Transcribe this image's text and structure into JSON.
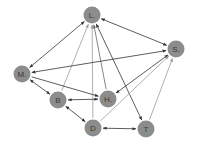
{
  "graph": {
    "nodes": [
      {
        "id": "L",
        "label": "L."
      },
      {
        "id": "S",
        "label": "S."
      },
      {
        "id": "M",
        "label": "M."
      },
      {
        "id": "B",
        "label": "B"
      },
      {
        "id": "H",
        "label": "H."
      },
      {
        "id": "D",
        "label": "D"
      },
      {
        "id": "T",
        "label": "T"
      }
    ],
    "edges": [
      {
        "from": "L",
        "to": "M",
        "dir": "both",
        "tone": "dark"
      },
      {
        "from": "L",
        "to": "S",
        "dir": "both",
        "tone": "dark"
      },
      {
        "from": "B",
        "to": "L",
        "dir": "forward",
        "tone": "light"
      },
      {
        "from": "D",
        "to": "L",
        "dir": "forward",
        "tone": "light"
      },
      {
        "from": "H",
        "to": "L",
        "dir": "forward",
        "tone": "mid"
      },
      {
        "from": "L",
        "to": "T",
        "dir": "both",
        "tone": "dark"
      },
      {
        "from": "M",
        "to": "S",
        "dir": "both",
        "tone": "dark"
      },
      {
        "from": "M",
        "to": "H",
        "dir": "forward",
        "tone": "dark"
      },
      {
        "from": "M",
        "to": "B",
        "dir": "both",
        "tone": "dark"
      },
      {
        "from": "B",
        "to": "H",
        "dir": "both",
        "tone": "dark"
      },
      {
        "from": "B",
        "to": "D",
        "dir": "both",
        "tone": "dark"
      },
      {
        "from": "D",
        "to": "T",
        "dir": "both",
        "tone": "dark"
      },
      {
        "from": "S",
        "to": "H",
        "dir": "both",
        "tone": "dark"
      },
      {
        "from": "D",
        "to": "S",
        "dir": "forward",
        "tone": "light"
      },
      {
        "from": "T",
        "to": "S",
        "dir": "forward",
        "tone": "light"
      }
    ]
  },
  "colors": {
    "node": "#8c8c8c",
    "dark": "#333333",
    "mid": "#666666",
    "light": "#9a9a9a"
  }
}
